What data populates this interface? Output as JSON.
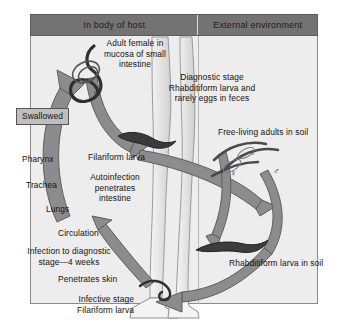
{
  "figure": {
    "title_implied": "Strongyloides stercoralis life cycle",
    "panels": {
      "left_header": "In body of host",
      "right_header": "External environment"
    },
    "colors": {
      "header_bar": "#737373",
      "panel_background": "#ededed",
      "arrow_fill": "#8c8c8c",
      "arrow_stroke": "#5e5e5e",
      "boxed_label_fill": "#bfbfbf",
      "text": "#111111",
      "frame_border": "#8a8a8a"
    },
    "labels": {
      "adult_female": "Adult female in\nmucosa of small\nintestine",
      "diagnostic_stage": "Diagnostic stage\nRhabditiform larva and\nrarely eggs in feces",
      "free_living_adults": "Free-living adults in soil",
      "rhabditiform_soil": "Rhabditiform larva in soil",
      "swallowed": "Swallowed",
      "pharynx": "Pharynx",
      "trachea": "Trachea",
      "lungs": "Lungs",
      "filariform_larva": "Filariform larva",
      "autoinfection": "Autoinfection\npenetrates\nintestine",
      "circulation": "Circulation",
      "infection_to_diagnostic": "Infection to diagnostic\nstage—4 weeks",
      "penetrates_skin": "Penetrates skin",
      "infective_stage": "Infective stage\nFilariform larva"
    },
    "symbols": {
      "female_adult_intestine": "♀",
      "free_living_male": "♂",
      "free_living_female": "♀",
      "free_living_male_2": "♂"
    },
    "icon_names": {
      "adult_worm": "adult-female-worm-icon",
      "filariform": "filariform-larva-icon",
      "rhabditiform": "rhabditiform-larva-icon",
      "free_living_pair": "free-living-adults-icon",
      "leg": "human-leg-silhouette-icon",
      "foot": "human-foot-silhouette-icon"
    }
  }
}
